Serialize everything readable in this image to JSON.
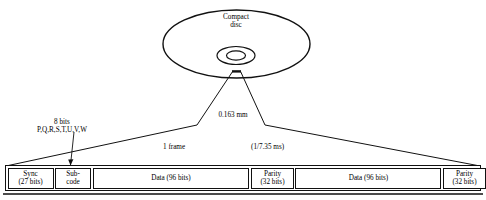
{
  "diagram": {
    "disc": {
      "label_line1": "Compact",
      "label_line2": "disc"
    },
    "callouts": {
      "thickness": "0.163 mm",
      "subcode_bits": "8 bits",
      "subcode_channels": "P,Q,R,S,T,U,V,W",
      "frame": "1 frame",
      "frame_duration": "(1/7.35 ms)"
    },
    "frame_bar": {
      "cells": [
        {
          "name": "sync",
          "line1": "Sync",
          "line2": "(27 bits)",
          "width": 46
        },
        {
          "name": "subcode",
          "line1": "Sub-",
          "line2": "code",
          "width": 36
        },
        {
          "name": "data1",
          "line1": "Data (96 bits)",
          "line2": "",
          "width": 157
        },
        {
          "name": "parity1",
          "line1": "Parity",
          "line2": "(32 bits)",
          "width": 43
        },
        {
          "name": "data2",
          "line1": "Data (96 bits)",
          "line2": "",
          "width": 146
        },
        {
          "name": "parity2",
          "line1": "Parity",
          "line2": "(32 bits)",
          "width": 43
        }
      ]
    },
    "colors": {
      "stroke": "#111111",
      "background": "#ffffff"
    }
  }
}
